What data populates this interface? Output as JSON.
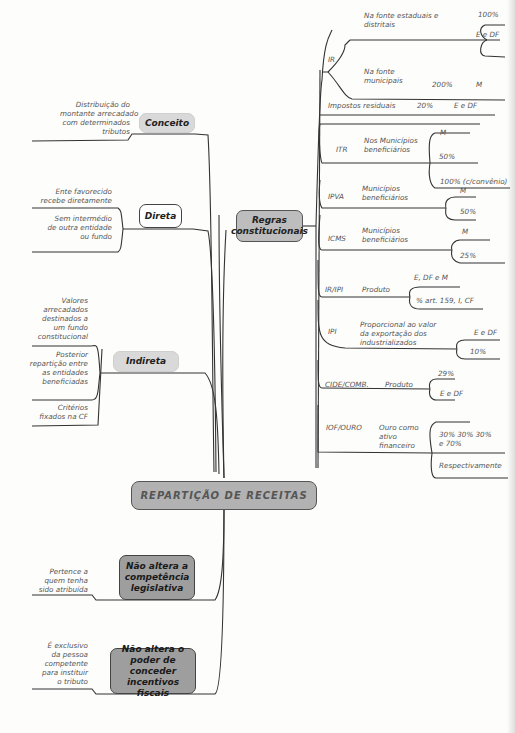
{
  "central": {
    "label": "REPARTIÇÃO DE RECEITAS"
  },
  "left": {
    "conceito": {
      "label": "Conceito",
      "note": [
        "Distribuição do",
        "montante arrecadado",
        "com determinados",
        "tributos"
      ]
    },
    "direta": {
      "label": "Direta",
      "notes": [
        [
          "Ente favorecido",
          "recebe diretamente"
        ],
        [
          "Sem intermédio",
          "de outra entidade",
          "ou fundo"
        ]
      ]
    },
    "indireta": {
      "label": "Indireta",
      "notes": [
        [
          "Valores",
          "arrecadados",
          "destinados a",
          "um fundo",
          "constitucional"
        ],
        [
          "Posterior",
          "repartição entre",
          "as entidades",
          "beneficiadas"
        ],
        [
          "Critérios",
          "fixados na CF"
        ]
      ]
    },
    "nao_altera_competencia": {
      "label": [
        "Não altera a",
        "competência",
        "legislativa"
      ],
      "note": [
        "Pertence a",
        "quem tenha",
        "sido atribuída"
      ]
    },
    "nao_altera_incentivos": {
      "label": [
        "Não altera o",
        "poder de conceder",
        "incentivos fiscais"
      ],
      "note": [
        "É exclusivo",
        "da pessoa",
        "competente",
        "para instituir",
        "o tributo"
      ]
    }
  },
  "right": {
    "regras": {
      "label": [
        "Regras",
        "constitucionais"
      ]
    },
    "ir": {
      "label": "IR",
      "fonte_estaduais": [
        "Na fonte estaduais e",
        "distritais"
      ],
      "fonte_estaduais_pct": "100%",
      "fonte_estaduais_dest": "E e DF",
      "fonte_municipais": [
        "Na fonte",
        "municipais"
      ],
      "fonte_municipais_pct": "200%",
      "fonte_municipais_dest": "M"
    },
    "residuais": {
      "label": "Impostos residuais",
      "pct": "20%",
      "dest": "E e DF"
    },
    "itr": {
      "label": "ITR",
      "desc": [
        "Nos Municípios",
        "beneficiários"
      ],
      "dest": "M",
      "opt1": "50%",
      "opt2": "100% (c/convênio)"
    },
    "ipva": {
      "label": "IPVA",
      "desc": [
        "Municípios",
        "beneficiários"
      ],
      "dest": "M",
      "pct": "50%"
    },
    "icms": {
      "label": "ICMS",
      "desc": [
        "Municípios",
        "beneficiários"
      ],
      "dest": "M",
      "pct": "25%"
    },
    "iripi": {
      "label": "IR/IPI",
      "desc": "Produto",
      "dest": "E, DF e M",
      "pct": "% art. 159, I, CF"
    },
    "ipi": {
      "label": "IPI",
      "desc": [
        "Proporcional ao valor",
        "da exportação dos",
        "industrializados"
      ],
      "dest": "E e DF",
      "pct": "10%"
    },
    "cide": {
      "label": "CIDE/COMB.",
      "desc": "Produto",
      "pct": "29%",
      "dest": "E e DF"
    },
    "iof": {
      "label": "IOF/OURO",
      "desc": [
        "Ouro como",
        "ativo",
        "financeiro"
      ],
      "pct": [
        "30% 30% 30%",
        "e 70%"
      ],
      "note": "Respectivamente"
    }
  }
}
